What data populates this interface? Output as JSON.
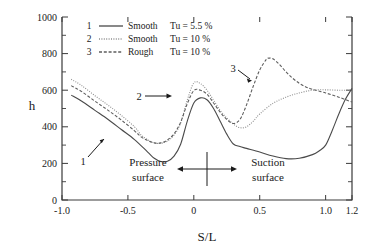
{
  "chart_data": {
    "type": "line",
    "title": "",
    "xlabel": "S/L",
    "ylabel": "h",
    "xlim": [
      -1.0,
      1.2
    ],
    "ylim": [
      0,
      1000
    ],
    "grid": false,
    "legend_position": "top-center-inside",
    "xticks": [
      -1.0,
      -0.5,
      0,
      0.5,
      1.0,
      1.2
    ],
    "xticklabels": [
      "-1.0",
      "-0.5",
      "0",
      "0.5",
      "1.0",
      "1.2"
    ],
    "yticks": [
      0,
      200,
      400,
      600,
      800,
      1000
    ],
    "yticklabels": [
      "0",
      "200",
      "400",
      "600",
      "800",
      "1000"
    ],
    "yminorticks": [
      100,
      300,
      500,
      700,
      900
    ],
    "series": [
      {
        "name": "1",
        "legend_number": "1",
        "legend_surface": "Smooth",
        "legend_tu": "Tu = 5.5 %",
        "style": "solid",
        "x": [
          -0.93,
          -0.85,
          -0.75,
          -0.65,
          -0.55,
          -0.45,
          -0.35,
          -0.3,
          -0.25,
          -0.2,
          -0.15,
          -0.1,
          -0.05,
          0.0,
          0.05,
          0.1,
          0.15,
          0.2,
          0.25,
          0.3,
          0.35,
          0.4,
          0.5,
          0.6,
          0.7,
          0.8,
          0.9,
          0.95,
          1.0,
          1.05,
          1.1,
          1.15,
          1.2
        ],
        "y": [
          573,
          540,
          490,
          440,
          385,
          330,
          262,
          228,
          210,
          212,
          240,
          305,
          430,
          530,
          558,
          548,
          500,
          430,
          360,
          306,
          292,
          282,
          262,
          240,
          226,
          228,
          248,
          268,
          300,
          380,
          470,
          550,
          610
        ]
      },
      {
        "name": "2",
        "legend_number": "2",
        "legend_surface": "Smooth",
        "legend_tu": "Tu = 10 %",
        "style": "dotted",
        "x": [
          -0.93,
          -0.85,
          -0.75,
          -0.65,
          -0.55,
          -0.45,
          -0.4,
          -0.35,
          -0.3,
          -0.25,
          -0.2,
          -0.15,
          -0.1,
          -0.05,
          0.0,
          0.05,
          0.1,
          0.15,
          0.2,
          0.25,
          0.3,
          0.35,
          0.4,
          0.45,
          0.5,
          0.6,
          0.7,
          0.8,
          0.9,
          1.0,
          1.1,
          1.2
        ],
        "y": [
          660,
          625,
          570,
          518,
          462,
          400,
          355,
          330,
          312,
          310,
          322,
          355,
          420,
          545,
          640,
          636,
          600,
          545,
          490,
          448,
          415,
          395,
          400,
          430,
          470,
          528,
          562,
          585,
          600,
          602,
          600,
          600
        ]
      },
      {
        "name": "3",
        "legend_number": "3",
        "legend_surface": "Rough",
        "legend_tu": "Tu = 10 %",
        "style": "dashed",
        "x": [
          -0.93,
          -0.85,
          -0.75,
          -0.65,
          -0.55,
          -0.45,
          -0.4,
          -0.35,
          -0.3,
          -0.25,
          -0.2,
          -0.15,
          -0.1,
          -0.05,
          0.0,
          0.05,
          0.1,
          0.15,
          0.2,
          0.25,
          0.3,
          0.35,
          0.4,
          0.45,
          0.5,
          0.55,
          0.57,
          0.6,
          0.65,
          0.7,
          0.75,
          0.8,
          0.85,
          0.9,
          1.0,
          1.1,
          1.2
        ],
        "y": [
          625,
          592,
          540,
          490,
          437,
          378,
          345,
          325,
          312,
          312,
          328,
          362,
          425,
          525,
          598,
          600,
          578,
          530,
          480,
          440,
          418,
          440,
          520,
          620,
          710,
          768,
          775,
          772,
          740,
          700,
          665,
          638,
          618,
          605,
          585,
          562,
          535
        ]
      }
    ],
    "annotations": [
      {
        "name": "curve-label-1",
        "text": "1",
        "x": -0.72,
        "y": 160
      },
      {
        "name": "curve-label-2",
        "text": "2",
        "x": -0.38,
        "y": 560
      },
      {
        "name": "curve-label-3",
        "text": "3",
        "x": 0.31,
        "y": 712
      },
      {
        "name": "pressure-surface-label",
        "text_line1": "Pressure",
        "text_line2": "surface"
      },
      {
        "name": "suction-surface-label",
        "text_line1": "Suction",
        "text_line2": "surface"
      }
    ]
  },
  "legend": {
    "rows": [
      {
        "num": "1",
        "surface": "Smooth",
        "tu": "Tu = 5.5 %",
        "style": "solid"
      },
      {
        "num": "2",
        "surface": "Smooth",
        "tu": "Tu = 10 %",
        "style": "dotted"
      },
      {
        "num": "3",
        "surface": "Rough",
        "tu": "Tu = 10 %",
        "style": "dashed"
      }
    ]
  },
  "labels": {
    "ylabel": "h",
    "xlabel": "S/L",
    "pressure_line1": "Pressure",
    "pressure_line2": "surface",
    "suction_line1": "Suction",
    "suction_line2": "surface",
    "curve1": "1",
    "curve2": "2",
    "curve3": "3"
  },
  "colors": {
    "axis": "#3a3a3a",
    "curve1": "#4a4a4a",
    "curve2": "#8d8d8d",
    "curve3": "#5d5d5d",
    "text": "#1a1a1a",
    "background": "#ffffff"
  }
}
